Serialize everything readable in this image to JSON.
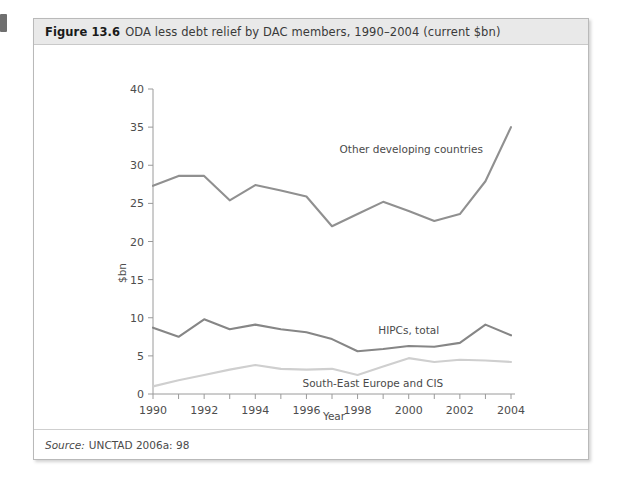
{
  "figure": {
    "number": "Figure 13.6",
    "title": "ODA less debt relief by DAC members, 1990–2004 (current $bn)",
    "source_label": "Source:",
    "source_text": "UNCTAD 2006a: 98"
  },
  "chart_data": {
    "type": "line",
    "title": "ODA less debt relief by DAC members, 1990–2004 (current $bn)",
    "xlabel": "Year",
    "ylabel": "$bn",
    "x": [
      1990,
      1991,
      1992,
      1993,
      1994,
      1995,
      1996,
      1997,
      1998,
      1999,
      2000,
      2001,
      2002,
      2003,
      2004
    ],
    "xtick_labels": [
      "1990",
      "1992",
      "1994",
      "1996",
      "1998",
      "2000",
      "2002",
      "2004"
    ],
    "xtick_values": [
      1990,
      1992,
      1994,
      1996,
      1998,
      2000,
      2002,
      2004
    ],
    "xlim": [
      1990,
      2004
    ],
    "ylim": [
      0,
      40
    ],
    "ytick_labels": [
      "0",
      "5",
      "10",
      "15",
      "20",
      "25",
      "30",
      "35",
      "40"
    ],
    "ytick_values": [
      0,
      5,
      10,
      15,
      20,
      25,
      30,
      35,
      40
    ],
    "grid": false,
    "legend_position": "inline-annotations",
    "series": [
      {
        "name": "Other developing countries",
        "color": "#909090",
        "label_x": 2000.1,
        "label_y": 31.6,
        "values": [
          27.3,
          28.6,
          28.6,
          25.4,
          27.4,
          26.7,
          25.9,
          22.0,
          23.6,
          25.2,
          24.0,
          22.7,
          23.6,
          27.9,
          35.0
        ]
      },
      {
        "name": "HIPCs, total",
        "color": "#868686",
        "label_x": 2000.0,
        "label_y": 7.9,
        "values": [
          8.7,
          7.5,
          9.8,
          8.5,
          9.1,
          8.5,
          8.1,
          7.2,
          5.6,
          5.9,
          6.3,
          6.2,
          6.7,
          9.1,
          7.7
        ]
      },
      {
        "name": "South-East Europe and CIS",
        "color": "#cfcfcf",
        "label_x": 1998.6,
        "label_y": 0.95,
        "values": [
          1.0,
          1.8,
          2.5,
          3.2,
          3.8,
          3.3,
          3.2,
          3.3,
          2.5,
          3.6,
          4.7,
          4.2,
          4.5,
          4.4,
          4.2
        ]
      }
    ]
  }
}
